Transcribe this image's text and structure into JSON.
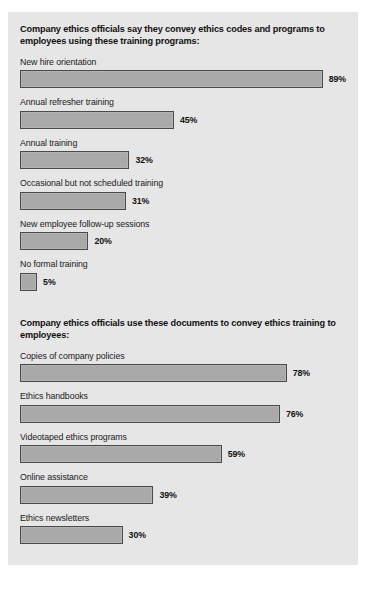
{
  "figure": {
    "background_color": "#e6e6e6",
    "bar_fill_color": "#a9a9a9",
    "bar_border_color": "#4a4a4a",
    "px_per_percent": 3.42
  },
  "chart_data": [
    {
      "type": "bar",
      "orientation": "horizontal",
      "title": "Company ethics officials say they convey ethics codes and programs to employees using these training programs:",
      "xlabel": "",
      "ylabel": "",
      "xlim": [
        0,
        100
      ],
      "grid": false,
      "legend": null,
      "categories": [
        "New hire orientation",
        "Annual refresher training",
        "Annual training",
        "Occasional but not scheduled training",
        "New employee follow-up sessions",
        "No formal training"
      ],
      "values": [
        89,
        45,
        32,
        31,
        20,
        5
      ],
      "value_labels": [
        "89%",
        "45%",
        "32%",
        "31%",
        "20%",
        "5%"
      ]
    },
    {
      "type": "bar",
      "orientation": "horizontal",
      "title": "Company ethics officials use these documents to convey ethics training to employees:",
      "xlabel": "",
      "ylabel": "",
      "xlim": [
        0,
        100
      ],
      "grid": false,
      "legend": null,
      "categories": [
        "Copies of company policies",
        "Ethics handbooks",
        "Videotaped ethics programs",
        "Online assistance",
        "Ethics newsletters"
      ],
      "values": [
        78,
        76,
        59,
        39,
        30
      ],
      "value_labels": [
        "78%",
        "76%",
        "59%",
        "39%",
        "30%"
      ]
    }
  ]
}
